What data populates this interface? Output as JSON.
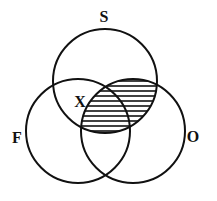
{
  "diagram": {
    "type": "venn-3",
    "sets": [
      {
        "id": "S",
        "label": "S",
        "cx": 105,
        "cy": 81,
        "r": 52,
        "label_x": 104,
        "label_y": 22
      },
      {
        "id": "F",
        "label": "F",
        "cx": 78,
        "cy": 131,
        "r": 52,
        "label_x": 17,
        "label_y": 143
      },
      {
        "id": "O",
        "label": "O",
        "cx": 133,
        "cy": 131,
        "r": 52,
        "label_x": 193,
        "label_y": 142
      }
    ],
    "shaded_region": "S ∩ O",
    "shading_style": "horizontal-hatch",
    "marker": {
      "label": "X",
      "region": "S ∩ F only",
      "x": 80,
      "y": 107
    },
    "stroke_color": "#111111",
    "background": "#ffffff"
  }
}
